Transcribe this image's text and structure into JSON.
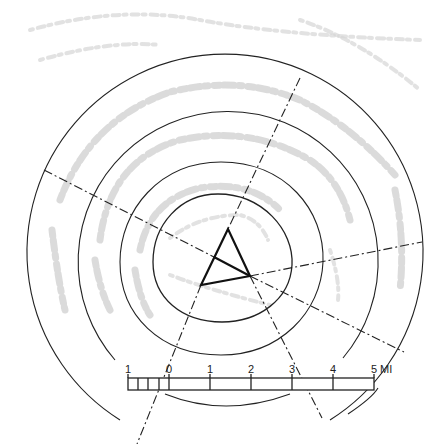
{
  "diagram": {
    "type": "concentric distance rings with triangulation",
    "scale_bar": {
      "labels": [
        "1",
        "0",
        "1",
        "2",
        "3",
        "4",
        "5"
      ],
      "unit": "MI",
      "subdivisions_left": 4
    },
    "colors": {
      "line": "#222222",
      "texture": "#cfcfcf",
      "background": "#ffffff"
    }
  }
}
